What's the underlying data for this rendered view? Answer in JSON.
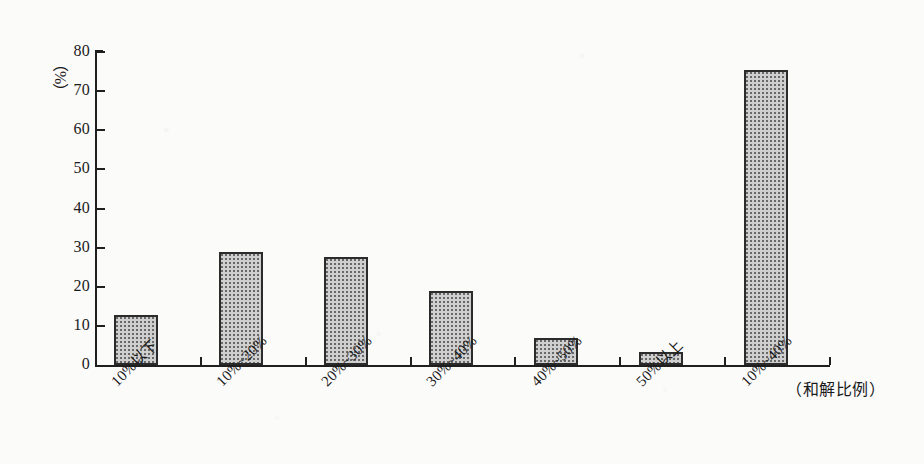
{
  "chart_data": {
    "type": "bar",
    "title": "",
    "subtitle": "",
    "xlabel": "（和解比例）",
    "ylabel": "（%）",
    "y_unit_label": "（%）",
    "categories": [
      "10%以下",
      "10%~20%",
      "20%~30%",
      "30%~40%",
      "40%~50%",
      "50%以上",
      "10%~40%"
    ],
    "values": [
      12.8,
      29.0,
      27.6,
      19.0,
      6.8,
      3.4,
      75.5
    ],
    "ylim": [
      0,
      80
    ],
    "ytick_values": [
      0,
      10,
      20,
      30,
      40,
      50,
      60,
      70,
      80
    ],
    "ytick_labels": [
      "0",
      "10",
      "20",
      "30",
      "40",
      "50",
      "60",
      "70",
      "80"
    ],
    "grid": false,
    "legend": null,
    "legend_position": "none",
    "series": [
      {
        "name": "和解比例",
        "values": [
          12.8,
          29.0,
          27.6,
          19.0,
          6.8,
          3.4,
          75.5
        ]
      }
    ],
    "colors": {
      "bar_fill": "#cfcfcf",
      "bar_border": "#2b2b2b",
      "axis": "#1f1f1f",
      "background": "#fbfbfa",
      "text": "#1a1a1a"
    }
  }
}
